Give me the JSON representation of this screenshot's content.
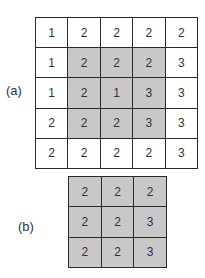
{
  "figure_a": {
    "label": "(a)",
    "rows": [
      [
        "1",
        "2",
        "2",
        "2",
        "2"
      ],
      [
        "1",
        "2",
        "2",
        "2",
        "3"
      ],
      [
        "1",
        "2",
        "1",
        "3",
        "3"
      ],
      [
        "2",
        "2",
        "2",
        "3",
        "3"
      ],
      [
        "2",
        "2",
        "2",
        "2",
        "3"
      ]
    ],
    "shaded_region": {
      "rows": [
        1,
        3
      ],
      "cols": [
        1,
        3
      ]
    }
  },
  "figure_b": {
    "label": "(b)",
    "rows": [
      [
        "2",
        "2",
        "2"
      ],
      [
        "2",
        "2",
        "3"
      ],
      [
        "2",
        "2",
        "3"
      ]
    ]
  },
  "colors": {
    "shade": "#c8c8c8",
    "border": "#2a2a2a",
    "text": "#333333"
  }
}
